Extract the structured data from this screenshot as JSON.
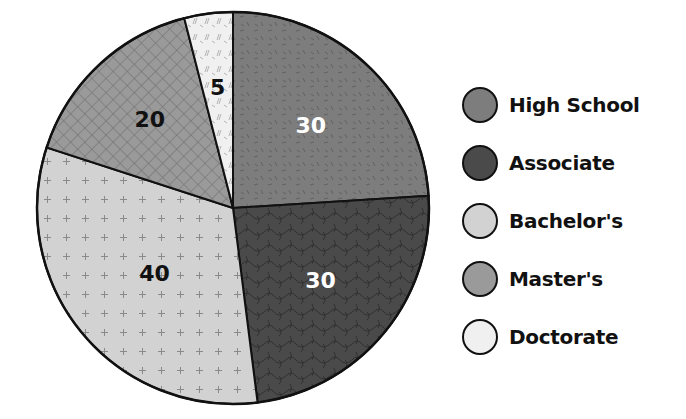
{
  "chart_data": {
    "type": "pie",
    "title": "",
    "categories": [
      "High School",
      "Associate",
      "Bachelor's",
      "Master's",
      "Doctorate"
    ],
    "values": [
      30,
      30,
      40,
      20,
      5
    ],
    "start_angle_deg": 0,
    "direction": "clockwise",
    "slice_colors": [
      "#7d7d7d",
      "#4a4a4a",
      "#d2d2d2",
      "#9a9a9a",
      "#f0f0f0"
    ],
    "label_colors": [
      "#ffffff",
      "#ffffff",
      "#111111",
      "#111111",
      "#111111"
    ],
    "legend_position": "right"
  },
  "legend": {
    "items": [
      {
        "label": "High School"
      },
      {
        "label": "Associate"
      },
      {
        "label": "Bachelor's"
      },
      {
        "label": "Master's"
      },
      {
        "label": "Doctorate"
      }
    ]
  }
}
